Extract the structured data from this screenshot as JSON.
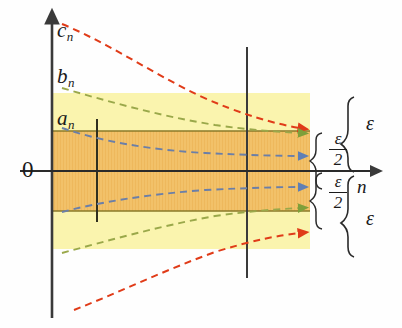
{
  "figure": {
    "background_color": "#fefefe"
  },
  "axes": {
    "vertical_axis_name": "vertical-axis",
    "horizontal_axis_label": "n",
    "origin_label": "0",
    "axis_color": "#3a3a3a"
  },
  "bands": {
    "outer": {
      "label": "epsilon-band",
      "color": "#faf4ae",
      "x0": 52,
      "x1": 310,
      "y_top": 93,
      "y_bottom": 249
    },
    "inner": {
      "label": "half-epsilon-band",
      "color": "#f2c169",
      "x0": 52,
      "x1": 310,
      "y_top": 131,
      "y_bottom": 211
    }
  },
  "curves": [
    {
      "name": "c_n",
      "label": "c",
      "subscript": "n",
      "color": "#e03b18",
      "style": "dashed",
      "branch": "upper",
      "path": "M 62 24 C 110 44, 150 72, 200 96 C 240 114, 275 124, 300 128",
      "arrow": true
    },
    {
      "name": "b_n",
      "label": "b",
      "subscript": "n",
      "color": "#9aa84a",
      "style": "dashed",
      "branch": "upper",
      "path": "M 62 88 C 110 102, 160 116, 215 125 C 250 130, 280 132, 300 133",
      "arrow": true
    },
    {
      "name": "a_n",
      "label": "a",
      "subscript": "n",
      "color": "#5f7fb5",
      "style": "dashed",
      "branch": "upper",
      "path": "M 62 128 C 100 141, 150 150, 205 153 C 245 155, 280 156, 300 156",
      "arrow": true
    },
    {
      "name": "a_n_lower",
      "label": "a",
      "subscript": "n",
      "color": "#5f7fb5",
      "style": "dashed",
      "branch": "lower",
      "path": "M 62 212 C 100 202, 150 194, 205 190 C 245 188, 280 187, 300 187",
      "arrow": true
    },
    {
      "name": "b_n_lower",
      "label": "b",
      "subscript": "n",
      "color": "#9aa84a",
      "style": "dashed",
      "branch": "lower",
      "path": "M 62 253 C 110 240, 160 226, 215 216 C 250 211, 280 209, 300 208",
      "arrow": true
    },
    {
      "name": "c_n_lower",
      "label": "c",
      "subscript": "n",
      "color": "#e03b18",
      "style": "dashed",
      "branch": "lower",
      "path": "M 74 310 C 120 292, 165 270, 215 252 C 250 241, 280 235, 300 233",
      "arrow": true
    }
  ],
  "vertical_markers": [
    {
      "name": "marker-N1",
      "x": 97,
      "y_top": 119,
      "y_bottom": 222
    },
    {
      "name": "marker-N2",
      "x": 247,
      "y_top": 47,
      "y_bottom": 278
    }
  ],
  "annotations": {
    "eps_upper": "ε",
    "eps_lower": "ε",
    "half_eps_upper_num": "ε",
    "half_eps_upper_den": "2",
    "half_eps_lower_num": "ε",
    "half_eps_lower_den": "2"
  },
  "labels": {
    "c_n_base": "c",
    "c_n_sub": "n",
    "b_n_base": "b",
    "b_n_sub": "n",
    "a_n_base": "a",
    "a_n_sub": "n",
    "origin": "0",
    "n_axis": "n"
  },
  "colors": {
    "red": "#e03b18",
    "green": "#9aa84a",
    "blue": "#5f7fb5",
    "yellow_band": "#faf4ae",
    "orange_band": "#f2c169",
    "band_edge": "#8a7a2a",
    "axis": "#3a3a3a",
    "text": "#1a1a1a"
  }
}
